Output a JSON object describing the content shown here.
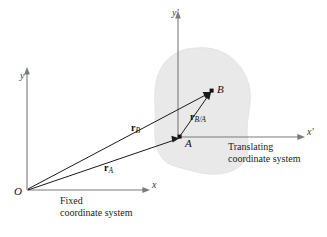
{
  "figure": {
    "width": 327,
    "height": 237,
    "background_color": "#ffffff"
  },
  "colors": {
    "axis": "#7a7a7a",
    "vector": "#1a1a1a",
    "blob_fill": "#e9e9ea",
    "blob_stroke": "#dcdcde",
    "text": "#1c1c1c",
    "point": "#111111"
  },
  "fixed_frame": {
    "origin_label": "O",
    "x_axis_label": "x",
    "y_axis_label": "y",
    "caption_line1": "Fixed",
    "caption_line2": "coordinate system"
  },
  "translating_frame": {
    "x_axis_label": "x'",
    "y_axis_label": "y'",
    "caption_line1": "Translating",
    "caption_line2": "coordinate system"
  },
  "points": [
    {
      "name": "A",
      "label": "A",
      "x": 180,
      "y": 137
    },
    {
      "name": "B",
      "label": "B",
      "x": 212,
      "y": 91
    }
  ],
  "vectors": [
    {
      "name": "r_A",
      "symbol": "r",
      "subscript": "A",
      "from": "O",
      "to": "A",
      "label_x": 104,
      "label_y": 163
    },
    {
      "name": "r_B",
      "symbol": "r",
      "subscript": "B",
      "from": "O",
      "to": "B",
      "label_x": 131,
      "label_y": 123
    },
    {
      "name": "r_B_over_A",
      "symbol": "r",
      "subscript": "B/A",
      "from": "A",
      "to": "B",
      "label_x": 190,
      "label_y": 112
    }
  ],
  "body": {
    "name": "rigid-body-blob",
    "description": "irregular gray body outline"
  }
}
